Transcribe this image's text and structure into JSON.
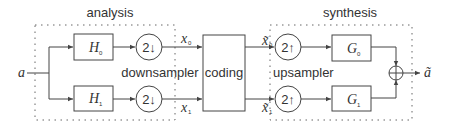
{
  "diagram": {
    "type": "two-channel filter bank",
    "groups": {
      "analysis": "analysis",
      "synthesis": "synthesis"
    },
    "input": {
      "symbol": "a"
    },
    "output": {
      "symbol": "ã"
    },
    "analysis_filters": [
      {
        "base": "H",
        "sub": "0"
      },
      {
        "base": "H",
        "sub": "1"
      }
    ],
    "downsamplers": [
      {
        "label": "2↓"
      },
      {
        "label": "2↓"
      }
    ],
    "downsampler_label": "downsampler",
    "coding_label": "coding",
    "coded_signals": [
      {
        "base": "x",
        "sub": "0"
      },
      {
        "base": "x",
        "sub": "1"
      }
    ],
    "decoded_signals": [
      {
        "base": "x̃",
        "sub": "0"
      },
      {
        "base": "x̃",
        "sub": "1"
      }
    ],
    "upsamplers": [
      {
        "label": "2↑"
      },
      {
        "label": "2↑"
      }
    ],
    "upsampler_label": "upsampler",
    "synthesis_filters": [
      {
        "base": "G",
        "sub": "0"
      },
      {
        "base": "G",
        "sub": "1"
      }
    ],
    "sum_symbol": "+"
  }
}
